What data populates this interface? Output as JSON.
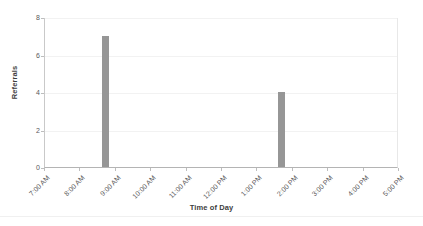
{
  "chart_data": {
    "type": "bar",
    "title": "",
    "xlabel": "Time of Day",
    "ylabel": "Referrals",
    "categories": [
      "7:00 AM",
      "8:00 AM",
      "9:00 AM",
      "10:00 AM",
      "11:00 AM",
      "12:00 PM",
      "1:00 PM",
      "2:00 PM",
      "3:00 PM",
      "4:00 PM",
      "5:00 PM"
    ],
    "ytick_labels": [
      "0",
      "2",
      "4",
      "6",
      "8"
    ],
    "ytick_values": [
      0,
      2,
      4,
      6,
      8
    ],
    "ylim": [
      0,
      8
    ],
    "xlim": [
      "7:00 AM",
      "5:00 PM"
    ],
    "grid": true,
    "grid_axis": "y",
    "legend": false,
    "bars": [
      {
        "label": "8:45 AM",
        "x_position": 1.72,
        "value": 7
      },
      {
        "label": "1:40 PM",
        "x_position": 6.67,
        "value": 4
      }
    ],
    "values": [
      0,
      0,
      7,
      0,
      0,
      0,
      0,
      4,
      0,
      0,
      0
    ],
    "bar_color": "#969696",
    "background_color": "#ffffff",
    "gridline_color": "#f2f2f2",
    "axis_color": "#b4b4b4",
    "text_color": "#595959"
  }
}
